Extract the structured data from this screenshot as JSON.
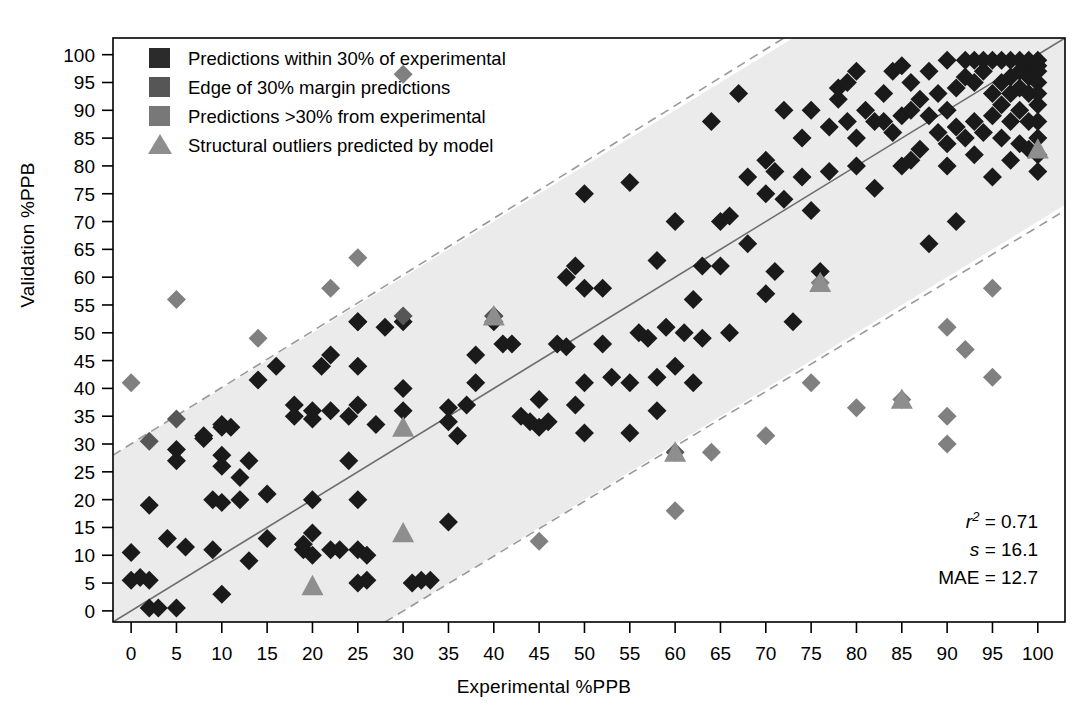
{
  "axes": {
    "xlabel": "Experimental %PPB",
    "ylabel": "Validation %PPB",
    "xticks": [
      "0",
      "5",
      "10",
      "15",
      "20",
      "25",
      "30",
      "35",
      "40",
      "45",
      "50",
      "55",
      "60",
      "65",
      "70",
      "75",
      "80",
      "85",
      "90",
      "95",
      "100"
    ],
    "yticks": [
      "0",
      "5",
      "10",
      "15",
      "20",
      "25",
      "30",
      "35",
      "40",
      "45",
      "50",
      "55",
      "60",
      "65",
      "70",
      "75",
      "80",
      "85",
      "90",
      "95",
      "100"
    ]
  },
  "legend": {
    "items": [
      {
        "label": "Predictions within 30% of experimental",
        "marker": "square",
        "color": "#2b2b2b"
      },
      {
        "label": "Edge of 30% margin predictions",
        "marker": "square",
        "color": "#565656"
      },
      {
        "label": "Predictions >30% from experimental",
        "marker": "square",
        "color": "#787878"
      },
      {
        "label": "Structural outliers predicted by model",
        "marker": "triangle",
        "color": "#8e8e8e"
      }
    ]
  },
  "stats": {
    "r2_symbol": "r",
    "r2_sup": "2",
    "r2_value": "= 0.71",
    "s_symbol": "s",
    "s_value": "= 16.1",
    "mae_symbol": "MAE",
    "mae_value": "= 12.7"
  },
  "colors": {
    "inside": "#1a1a1a",
    "edge": "#565656",
    "outside": "#808080",
    "outlier": "#8e8e8e",
    "band_fill": "#ebebeb",
    "band_edge": "#9a9a9a",
    "identity_line": "#6e6e6e",
    "axis": "#000000"
  },
  "chart_data": {
    "type": "scatter",
    "title": "",
    "xlabel": "Experimental %PPB",
    "ylabel": "Validation %PPB",
    "xlim": [
      -2,
      103
    ],
    "ylim": [
      -2,
      103
    ],
    "grid": false,
    "legend_position": "top-left",
    "reference_lines": [
      {
        "name": "identity",
        "type": "line",
        "from": [
          -2,
          -2
        ],
        "to": [
          103,
          103
        ],
        "style": "solid",
        "color": "#6e6e6e"
      },
      {
        "name": "upper-30pct-margin",
        "type": "line",
        "from": [
          -2,
          28
        ],
        "to": [
          72,
          103
        ],
        "style": "dashed",
        "color": "#9a9a9a"
      },
      {
        "name": "lower-30pct-margin",
        "type": "line",
        "from": [
          28,
          -2
        ],
        "to": [
          103,
          72
        ],
        "style": "dashed",
        "color": "#9a9a9a"
      }
    ],
    "shaded_band": {
      "name": "within-30pct-band",
      "half_width": 30,
      "fill": "#ebebeb"
    },
    "annotations": [
      {
        "text": "r2 = 0.71",
        "x": 95,
        "y": 15
      },
      {
        "text": "s = 16.1",
        "x": 95,
        "y": 10
      },
      {
        "text": "MAE = 12.7",
        "x": 95,
        "y": 5
      }
    ],
    "series": [
      {
        "name": "Predictions within 30% of experimental",
        "marker": "diamond",
        "color": "#1a1a1a",
        "points": [
          [
            0,
            10.5
          ],
          [
            0,
            5.5
          ],
          [
            1,
            6
          ],
          [
            2,
            19
          ],
          [
            2,
            5.5
          ],
          [
            2,
            0.5
          ],
          [
            3,
            0.5
          ],
          [
            4,
            13
          ],
          [
            5,
            27
          ],
          [
            5,
            29
          ],
          [
            5,
            0.5
          ],
          [
            6,
            11.5
          ],
          [
            8,
            31
          ],
          [
            8,
            31.5
          ],
          [
            9,
            20
          ],
          [
            9,
            11
          ],
          [
            10,
            33
          ],
          [
            10,
            33.5
          ],
          [
            10,
            28
          ],
          [
            10,
            26
          ],
          [
            10,
            19.5
          ],
          [
            10,
            3
          ],
          [
            11,
            33
          ],
          [
            12,
            24
          ],
          [
            12,
            20
          ],
          [
            13,
            27
          ],
          [
            13,
            9
          ],
          [
            14,
            41.5
          ],
          [
            15,
            21
          ],
          [
            16,
            44
          ],
          [
            18,
            37
          ],
          [
            18,
            35
          ],
          [
            19,
            12
          ],
          [
            19,
            11
          ],
          [
            20,
            36
          ],
          [
            20,
            34.5
          ],
          [
            20,
            20
          ],
          [
            20,
            14
          ],
          [
            21,
            44
          ],
          [
            22,
            46
          ],
          [
            22,
            36
          ],
          [
            22,
            11
          ],
          [
            24,
            35
          ],
          [
            24,
            27
          ],
          [
            25,
            52
          ],
          [
            25,
            52
          ],
          [
            25,
            44
          ],
          [
            25,
            37
          ],
          [
            25,
            20
          ],
          [
            25,
            11
          ],
          [
            25,
            5
          ],
          [
            26,
            5.5
          ],
          [
            27,
            33.5
          ],
          [
            28,
            51
          ],
          [
            30,
            52
          ],
          [
            30,
            40
          ],
          [
            31,
            5
          ],
          [
            32,
            5.5
          ],
          [
            33,
            5.5
          ],
          [
            35,
            16
          ],
          [
            35,
            36.5
          ],
          [
            36,
            31.5
          ],
          [
            37,
            37
          ],
          [
            38,
            41
          ],
          [
            38,
            46
          ],
          [
            40,
            52
          ],
          [
            40,
            53
          ],
          [
            41,
            48
          ],
          [
            42,
            48
          ],
          [
            43,
            35
          ],
          [
            44,
            34
          ],
          [
            45,
            33
          ],
          [
            46,
            34
          ],
          [
            47,
            48
          ],
          [
            48,
            47.5
          ],
          [
            48,
            60
          ],
          [
            49,
            62
          ],
          [
            50,
            58
          ],
          [
            50,
            75
          ],
          [
            50,
            41
          ],
          [
            50,
            32
          ],
          [
            52,
            58
          ],
          [
            53,
            42
          ],
          [
            55,
            77
          ],
          [
            55,
            32
          ],
          [
            56,
            50
          ],
          [
            57,
            49
          ],
          [
            58,
            63
          ],
          [
            58,
            42
          ],
          [
            59,
            51
          ],
          [
            60,
            70
          ],
          [
            60,
            44
          ],
          [
            61,
            50
          ],
          [
            62,
            56
          ],
          [
            63,
            62
          ],
          [
            63,
            49
          ],
          [
            64,
            88
          ],
          [
            65,
            70
          ],
          [
            65,
            62
          ],
          [
            66,
            71
          ],
          [
            67,
            93
          ],
          [
            68,
            78
          ],
          [
            68,
            66
          ],
          [
            70,
            81
          ],
          [
            70,
            75
          ],
          [
            70,
            57
          ],
          [
            71,
            79
          ],
          [
            72,
            74
          ],
          [
            72,
            90
          ],
          [
            73,
            52
          ],
          [
            74,
            78
          ],
          [
            75,
            72
          ],
          [
            75,
            90
          ],
          [
            76,
            61
          ],
          [
            77,
            87
          ],
          [
            78,
            92
          ],
          [
            78,
            94
          ],
          [
            79,
            88
          ],
          [
            80,
            80
          ],
          [
            80,
            97
          ],
          [
            80,
            85
          ],
          [
            81,
            90
          ],
          [
            82,
            76
          ],
          [
            82,
            88
          ],
          [
            83,
            93
          ],
          [
            84,
            97
          ],
          [
            84,
            86
          ],
          [
            85,
            98
          ],
          [
            85,
            89
          ],
          [
            85,
            80
          ],
          [
            86,
            90
          ],
          [
            86,
            95
          ],
          [
            87,
            83
          ],
          [
            87,
            92
          ],
          [
            88,
            66
          ],
          [
            88,
            97
          ],
          [
            89,
            86
          ],
          [
            89,
            93
          ],
          [
            90,
            99
          ],
          [
            90,
            84
          ],
          [
            90,
            80
          ],
          [
            90,
            90
          ],
          [
            91,
            94
          ],
          [
            91,
            70
          ],
          [
            92,
            85
          ],
          [
            92,
            96
          ],
          [
            92,
            99
          ],
          [
            93,
            88
          ],
          [
            93,
            95
          ],
          [
            93,
            82
          ],
          [
            94,
            97
          ],
          [
            94,
            99
          ],
          [
            94,
            86
          ],
          [
            95,
            99
          ],
          [
            95,
            93
          ],
          [
            95,
            89
          ],
          [
            95,
            78
          ],
          [
            96,
            99
          ],
          [
            96,
            95
          ],
          [
            96,
            91
          ],
          [
            96,
            85
          ],
          [
            97,
            99
          ],
          [
            97,
            96
          ],
          [
            97,
            93
          ],
          [
            97,
            88
          ],
          [
            97,
            81
          ],
          [
            98,
            99
          ],
          [
            98,
            97
          ],
          [
            98,
            94
          ],
          [
            98,
            90
          ],
          [
            98,
            84
          ],
          [
            99,
            99
          ],
          [
            99,
            98
          ],
          [
            99,
            96
          ],
          [
            99,
            93
          ],
          [
            99,
            88
          ],
          [
            99,
            83
          ],
          [
            100,
            99
          ],
          [
            100,
            98
          ],
          [
            100,
            97
          ],
          [
            100,
            95
          ],
          [
            100,
            93
          ],
          [
            100,
            91
          ],
          [
            100,
            88
          ],
          [
            100,
            85
          ],
          [
            100,
            82
          ],
          [
            100,
            79
          ],
          [
            62,
            41
          ],
          [
            49,
            37
          ],
          [
            58,
            36
          ],
          [
            35,
            34
          ],
          [
            30,
            36
          ],
          [
            15,
            13
          ],
          [
            20,
            10
          ],
          [
            23,
            11
          ],
          [
            26,
            10
          ],
          [
            45,
            38
          ],
          [
            55,
            41
          ],
          [
            52,
            48
          ],
          [
            66,
            50
          ],
          [
            71,
            61
          ],
          [
            74,
            85
          ],
          [
            77,
            79
          ],
          [
            79,
            95
          ],
          [
            83,
            88
          ],
          [
            86,
            81
          ],
          [
            88,
            89
          ],
          [
            91,
            87
          ],
          [
            93,
            99
          ]
        ]
      },
      {
        "name": "Edge of 30% margin predictions",
        "marker": "diamond",
        "color": "#565656",
        "points": [
          [
            2,
            30.5
          ],
          [
            5,
            34.5
          ],
          [
            30,
            53
          ],
          [
            40,
            53
          ],
          [
            60,
            28.5
          ]
        ]
      },
      {
        "name": "Predictions >30% from experimental",
        "marker": "diamond",
        "color": "#808080",
        "points": [
          [
            0,
            41
          ],
          [
            5,
            56
          ],
          [
            14,
            49
          ],
          [
            22,
            58
          ],
          [
            25,
            63.5
          ],
          [
            30,
            96.5
          ],
          [
            45,
            12.5
          ],
          [
            60,
            18
          ],
          [
            64,
            28.5
          ],
          [
            70,
            31.5
          ],
          [
            75,
            41
          ],
          [
            76,
            59
          ],
          [
            80,
            36.5
          ],
          [
            85,
            38
          ],
          [
            90,
            51
          ],
          [
            90,
            35
          ],
          [
            90,
            30
          ],
          [
            92,
            47
          ],
          [
            95,
            58
          ],
          [
            95,
            42
          ]
        ]
      },
      {
        "name": "Structural outliers predicted by model",
        "marker": "triangle",
        "color": "#8e8e8e",
        "points": [
          [
            20,
            4.5
          ],
          [
            30,
            14
          ],
          [
            30,
            33
          ],
          [
            40,
            53
          ],
          [
            60,
            28.5
          ],
          [
            76,
            59
          ],
          [
            85,
            38
          ],
          [
            100,
            83
          ]
        ]
      }
    ]
  }
}
